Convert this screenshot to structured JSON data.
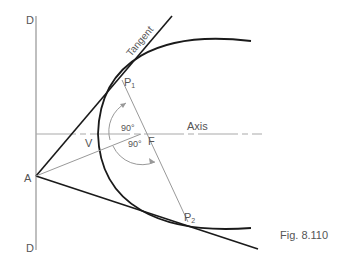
{
  "figure": {
    "caption": "Fig. 8.110",
    "labels": {
      "directrix_top": "D",
      "directrix_bottom": "D",
      "point_a": "A",
      "vertex": "V",
      "focus": "F",
      "point_p1": "P",
      "point_p1_sub": "1",
      "point_p2": "P",
      "point_p2_sub": "2",
      "axis": "Axis",
      "tangent": "Tangent",
      "angle_upper": "90°",
      "angle_lower": "90°"
    },
    "colors": {
      "primary_line": "#1a1a1a",
      "construction_line": "#999999",
      "directrix": "#aaaaaa",
      "text": "#555555"
    }
  }
}
